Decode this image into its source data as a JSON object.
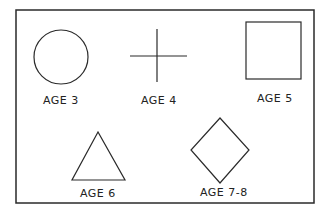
{
  "diagram": {
    "shapes": [
      {
        "shape": "circle",
        "label": "AGE 3"
      },
      {
        "shape": "cross",
        "label": "AGE 4"
      },
      {
        "shape": "square",
        "label": "AGE 5"
      },
      {
        "shape": "triangle",
        "label": "AGE 6"
      },
      {
        "shape": "diamond",
        "label": "AGE 7-8"
      }
    ],
    "colors": {
      "ink": "#2a2a2a",
      "background": "#ffffff"
    }
  }
}
